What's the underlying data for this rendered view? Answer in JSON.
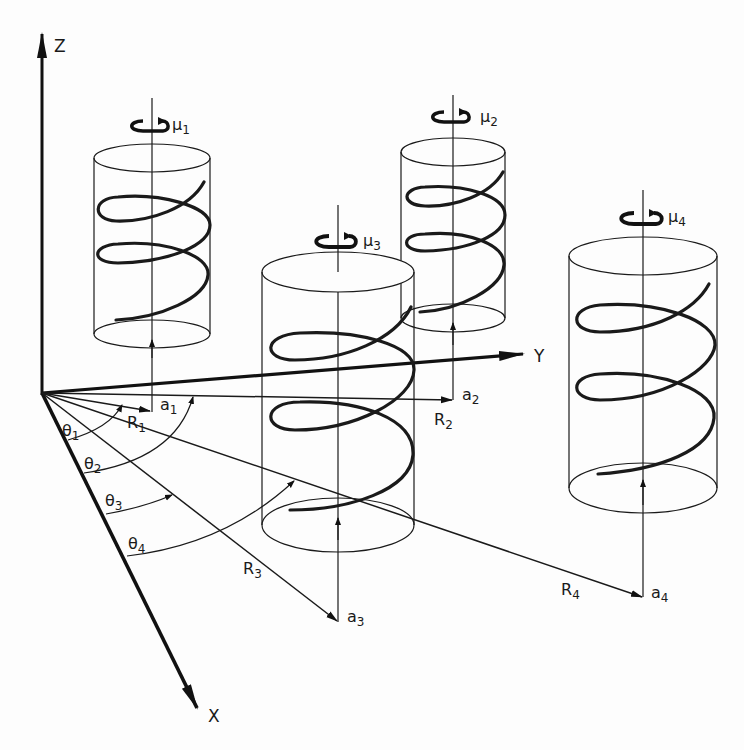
{
  "diagram": {
    "axes": {
      "z": "Z",
      "y": "Y",
      "x": "X"
    },
    "helices": [
      {
        "id": 1,
        "mu_label": "μ",
        "mu_sub": "1",
        "a_label": "a",
        "a_sub": "1",
        "R_label": "R",
        "R_sub": "1",
        "theta_label": "θ",
        "theta_sub": "1"
      },
      {
        "id": 2,
        "mu_label": "μ",
        "mu_sub": "2",
        "a_label": "a",
        "a_sub": "2",
        "R_label": "R",
        "R_sub": "2",
        "theta_label": "θ",
        "theta_sub": "2"
      },
      {
        "id": 3,
        "mu_label": "μ",
        "mu_sub": "3",
        "a_label": "a",
        "a_sub": "3",
        "R_label": "R",
        "R_sub": "3",
        "theta_label": "θ",
        "theta_sub": "3"
      },
      {
        "id": 4,
        "mu_label": "μ",
        "mu_sub": "4",
        "a_label": "a",
        "a_sub": "4",
        "R_label": "R",
        "R_sub": "4",
        "theta_label": "θ",
        "theta_sub": "4"
      }
    ],
    "icons": {
      "rotation": "rotation-arrow-icon"
    },
    "colors": {
      "ink": "#1a1a1a",
      "paper": "#fdfdfd"
    }
  }
}
